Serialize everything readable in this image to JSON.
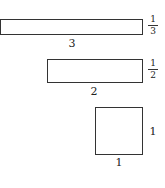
{
  "figure": {
    "shapes": [
      {
        "name": "rectangle-3-by-one-third",
        "length": "3",
        "width_num": "1",
        "width_den": "3"
      },
      {
        "name": "rectangle-2-by-one-half",
        "length": "2",
        "width_num": "1",
        "width_den": "2"
      },
      {
        "name": "square-1-by-1",
        "length": "1",
        "width": "1"
      }
    ]
  }
}
